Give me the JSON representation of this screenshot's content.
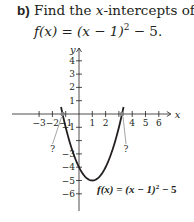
{
  "problem": {
    "label": "b)",
    "text": " Find the ",
    "var": "x",
    "text2": "-intercepts of",
    "function": "f(x) = (x − 1)",
    "exponent": "2",
    "tail": " − 5."
  },
  "chart_data": {
    "type": "line",
    "title": "",
    "function_label": "f(x) = (x − 1)² − 5",
    "function_label_parts": {
      "main": "f(x) = (x − 1)",
      "exp": "2",
      "tail": " − 5"
    },
    "xlabel": "x",
    "ylabel": "y",
    "xlim": [
      -4,
      7
    ],
    "ylim": [
      -7,
      5
    ],
    "x_ticks": [
      -3,
      -2,
      -1,
      1,
      2,
      4,
      5,
      6
    ],
    "x_tick_labels": [
      "−3",
      "−2",
      "−1",
      "1",
      "2",
      "4",
      "5",
      "6"
    ],
    "y_ticks": [
      4,
      3,
      2,
      1,
      -1,
      -3,
      -4,
      -5,
      -6
    ],
    "y_tick_labels": [
      "4",
      "3",
      "2",
      "1",
      "−1",
      "−3",
      "−4",
      "−5",
      "−6"
    ],
    "grid": false,
    "series": [
      {
        "name": "f(x) = (x − 1)^2 − 5",
        "vertex": [
          1,
          -5
        ],
        "a": 1,
        "x_range": [
          -1.35,
          3.35
        ]
      }
    ],
    "intercepts": [
      {
        "x": -1.236,
        "y": 0,
        "label": "?"
      },
      {
        "x": 3.236,
        "y": 0,
        "label": "?"
      }
    ],
    "colors": {
      "curve": "#231f20",
      "axis": "#231f20",
      "intercept_marker": "#808080",
      "pointer": "#808080"
    }
  }
}
